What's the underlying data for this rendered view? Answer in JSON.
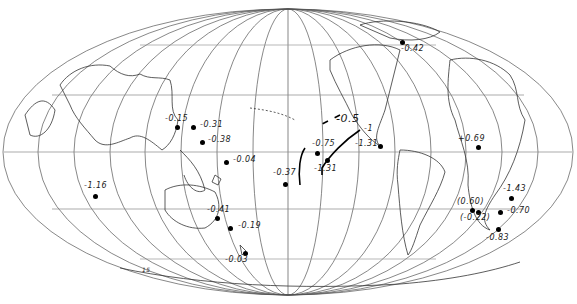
{
  "map": {
    "projection": "mollweide-like world map, Pacific-centered",
    "contour_labels": [
      {
        "text": "-0.5",
        "x": 338,
        "y": 119
      },
      {
        "text": "-1",
        "x": 365,
        "y": 127
      }
    ],
    "corner_label": {
      "text": "15",
      "x": 142,
      "y": 270
    },
    "stations": [
      {
        "label": "-0.42",
        "dot_x": 402,
        "dot_y": 42,
        "label_x": 401,
        "label_y": 47
      },
      {
        "label": "-0.15",
        "dot_x": 177,
        "dot_y": 127,
        "label_x": 165,
        "label_y": 117
      },
      {
        "label": "-0.31",
        "dot_x": 193,
        "dot_y": 127,
        "label_x": 200,
        "label_y": 123
      },
      {
        "label": "-0.38",
        "dot_x": 202,
        "dot_y": 142,
        "label_x": 208,
        "label_y": 138
      },
      {
        "label": "-0.04",
        "dot_x": 226,
        "dot_y": 162,
        "label_x": 233,
        "label_y": 158
      },
      {
        "label": "-0.37",
        "dot_x": 285,
        "dot_y": 184,
        "label_x": 273,
        "label_y": 171
      },
      {
        "label": "-0.75",
        "dot_x": 317,
        "dot_y": 153,
        "label_x": 312,
        "label_y": 142
      },
      {
        "label": "-1.31",
        "dot_x": 327,
        "dot_y": 160,
        "label_x": 314,
        "label_y": 167
      },
      {
        "label": "-1.31",
        "dot_x": 380,
        "dot_y": 146,
        "label_x": 356,
        "label_y": 142
      },
      {
        "label": "+0.69",
        "dot_x": 478,
        "dot_y": 147,
        "label_x": 458,
        "label_y": 137
      },
      {
        "label": "-1.16",
        "dot_x": 95,
        "dot_y": 196,
        "label_x": 85,
        "label_y": 184
      },
      {
        "label": "-0.41",
        "dot_x": 217,
        "dot_y": 218,
        "label_x": 208,
        "label_y": 208
      },
      {
        "label": "-0.19",
        "dot_x": 230,
        "dot_y": 228,
        "label_x": 238,
        "label_y": 224
      },
      {
        "label": "-0.03",
        "dot_x": 245,
        "dot_y": 253,
        "label_x": 225,
        "label_y": 258
      },
      {
        "label": "(0.60)",
        "dot_x": 472,
        "dot_y": 210,
        "label_x": 458,
        "label_y": 200
      },
      {
        "label": "(-0.22)",
        "dot_x": 478,
        "dot_y": 212,
        "label_x": 460,
        "label_y": 216
      },
      {
        "label": "-1.43",
        "dot_x": 511,
        "dot_y": 198,
        "label_x": 503,
        "label_y": 187
      },
      {
        "label": "-0.70",
        "dot_x": 500,
        "dot_y": 212,
        "label_x": 507,
        "label_y": 209
      },
      {
        "label": "-0.83",
        "dot_x": 498,
        "dot_y": 229,
        "label_x": 486,
        "label_y": 235
      }
    ]
  }
}
